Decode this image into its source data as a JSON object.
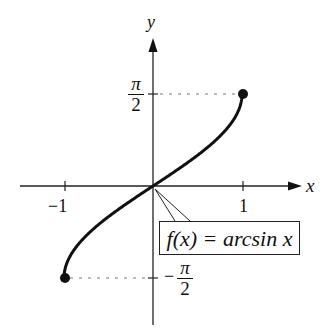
{
  "chart_data": {
    "type": "line",
    "title": "",
    "function_label": "f(x) = arcsin x",
    "xlabel": "x",
    "ylabel": "y",
    "xlim": [
      -1.5,
      1.5
    ],
    "ylim": [
      -2.4,
      2.4
    ],
    "x_ticks": [
      {
        "value": -1,
        "label": "−1"
      },
      {
        "value": 1,
        "label": "1"
      }
    ],
    "y_ticks": [
      {
        "value": 1.5708,
        "label": "π/2"
      },
      {
        "value": -1.5708,
        "label": "−π/2"
      }
    ],
    "series": [
      {
        "name": "f(x) = arcsin x",
        "x": [
          -1,
          -0.9,
          -0.75,
          -0.5,
          -0.25,
          0,
          0.25,
          0.5,
          0.75,
          0.9,
          1
        ],
        "y": [
          -1.5708,
          -1.1198,
          -0.8481,
          -0.5236,
          -0.2527,
          0,
          0.2527,
          0.5236,
          0.8481,
          1.1198,
          1.5708
        ]
      }
    ],
    "endpoints": [
      {
        "x": -1,
        "y": -1.5708,
        "style": "filled"
      },
      {
        "x": 1,
        "y": 1.5708,
        "style": "filled"
      }
    ],
    "grid": false,
    "guides": "dotted lines from endpoints to y-axis"
  },
  "labels": {
    "x_axis": "x",
    "y_axis": "y",
    "x_tick_neg": "−1",
    "x_tick_pos": "1",
    "pi": "π",
    "two": "2",
    "minus": "−",
    "function": "f(x) = arcsin x"
  }
}
